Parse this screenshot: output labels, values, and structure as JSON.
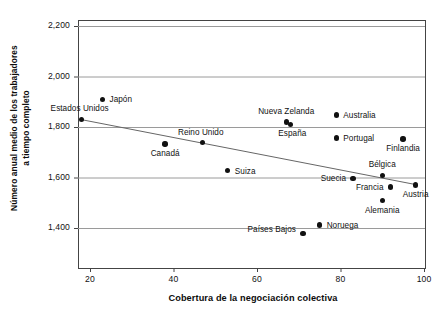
{
  "chart_data": {
    "type": "scatter",
    "title": "",
    "xlabel": "Cobertura de la negociación colectiva",
    "ylabel": "Número anual medio de los trabajadores a tiempo completo",
    "ylabel_line1": "Número anual medio de los trabajadores",
    "ylabel_line2": "a tiempo completo",
    "xlim": [
      14,
      102
    ],
    "ylim": [
      1360,
      2216
    ],
    "xticks": [
      20,
      40,
      60,
      80,
      100
    ],
    "xtick_labels": [
      "20",
      "40",
      "60",
      "80",
      "100"
    ],
    "yticks": [
      1400,
      1600,
      1800,
      2000,
      2200
    ],
    "ytick_labels": [
      "1,400",
      "1,600",
      "1,800",
      "2,000",
      "2,200"
    ],
    "grid": "horizontal",
    "legend": "none",
    "marker_color": "#111111",
    "gridline_color": "#9a9a9a",
    "axis_color": "#444444",
    "trendline": {
      "label": "",
      "x": [
        18,
        98
      ],
      "y": [
        1829,
        1572
      ],
      "color": "#666666"
    },
    "points": [
      {
        "name": "Japón",
        "x": 23,
        "y": 1910,
        "label_pos": "right"
      },
      {
        "name": "Estados Unidos",
        "x": 18,
        "y": 1830,
        "label_pos": "above-right"
      },
      {
        "name": "Canadá",
        "x": 38,
        "y": 1733,
        "label_pos": "below"
      },
      {
        "name": "Reino Unido",
        "x": 47,
        "y": 1738,
        "label_pos": "above-right"
      },
      {
        "name": "Suiza",
        "x": 53,
        "y": 1627,
        "label_pos": "right"
      },
      {
        "name": "Nueva Zelanda",
        "x": 67,
        "y": 1820,
        "label_pos": "above"
      },
      {
        "name": "España",
        "x": 68,
        "y": 1810,
        "label_pos": "below-right"
      },
      {
        "name": "Australia",
        "x": 79,
        "y": 1848,
        "label_pos": "right"
      },
      {
        "name": "Portugal",
        "x": 79,
        "y": 1757,
        "label_pos": "right"
      },
      {
        "name": "Finlandia",
        "x": 95,
        "y": 1753,
        "label_pos": "below"
      },
      {
        "name": "Suecia",
        "x": 83,
        "y": 1597,
        "label_pos": "left"
      },
      {
        "name": "Bélgica",
        "x": 90,
        "y": 1609,
        "label_pos": "above"
      },
      {
        "name": "Francia",
        "x": 92,
        "y": 1562,
        "label_pos": "left"
      },
      {
        "name": "Austria",
        "x": 98,
        "y": 1570,
        "label_pos": "below"
      },
      {
        "name": "Alemania",
        "x": 90,
        "y": 1508,
        "label_pos": "below"
      },
      {
        "name": "Países Bajos",
        "x": 71,
        "y": 1378,
        "label_pos": "above-left"
      },
      {
        "name": "Noruega",
        "x": 75,
        "y": 1412,
        "label_pos": "right"
      }
    ]
  }
}
